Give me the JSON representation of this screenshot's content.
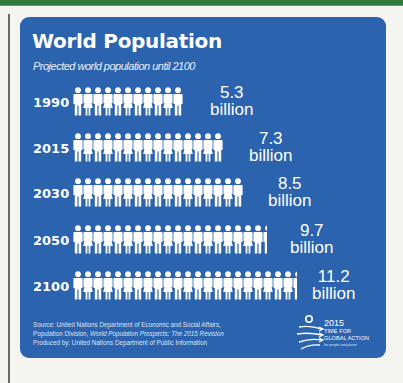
{
  "page": {
    "top_bar_color": "#2f7a3a",
    "panel_color": "#2b63ae",
    "icon_color": "#ffffff"
  },
  "header": {
    "title": "World Population",
    "subtitle": "Projected world population until 2100"
  },
  "rows": [
    {
      "year": "1990",
      "value": "5.3",
      "unit": "billion",
      "icons": 11,
      "partial": false
    },
    {
      "year": "2015",
      "value": "7.3",
      "unit": "billion",
      "icons": 15,
      "partial": false
    },
    {
      "year": "2030",
      "value": "8.5",
      "unit": "billion",
      "icons": 17,
      "partial": false
    },
    {
      "year": "2050",
      "value": "9.7",
      "unit": "billion",
      "icons": 19,
      "partial": true
    },
    {
      "year": "2100",
      "value": "11.2",
      "unit": "billion",
      "icons": 22,
      "partial": true
    }
  ],
  "footer": {
    "line1": "Source: United Nations Department of Economic and Social Affairs,",
    "line2_prefix": "Population Division, ",
    "line2_italic": "World Population Prospects: The 2015 Revision",
    "line3": "Produced by: United Nations Department of Public Information"
  },
  "logo": {
    "year": "2015",
    "line1": "TIME FOR",
    "line2": "GLOBAL ACTION",
    "small": "for people and planet"
  },
  "chart_data": {
    "type": "bar",
    "title": "World Population",
    "subtitle": "Projected world population until 2100",
    "categories": [
      "1990",
      "2015",
      "2030",
      "2050",
      "2100"
    ],
    "values": [
      5.3,
      7.3,
      8.5,
      9.7,
      11.2
    ],
    "unit": "billion",
    "orientation": "horizontal",
    "style": "pictogram (person icons, ~0.5 billion per icon)",
    "xlabel": "",
    "ylabel": "",
    "data_labels": [
      "5.3 billion",
      "7.3 billion",
      "8.5 billion",
      "9.7 billion",
      "11.2 billion"
    ],
    "source": "United Nations Department of Economic and Social Affairs, Population Division, World Population Prospects: The 2015 Revision",
    "grid": false,
    "legend": null
  }
}
